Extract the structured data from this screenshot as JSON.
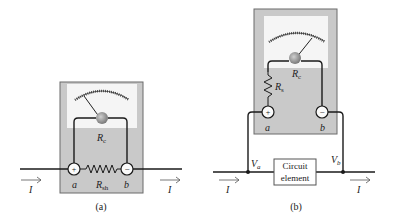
{
  "diagram_a": {
    "caption": "(a)",
    "meter_resistance": "R",
    "meter_resistance_sub": "c",
    "shunt_resistance": "R",
    "shunt_resistance_sub": "sh",
    "terminal_plus": "+",
    "terminal_minus": "−",
    "node_a": "a",
    "node_b": "b",
    "current_in": "I",
    "current_out": "I"
  },
  "diagram_b": {
    "caption": "(b)",
    "meter_resistance": "R",
    "meter_resistance_sub": "c",
    "series_resistance": "R",
    "series_resistance_sub": "s",
    "terminal_plus": "+",
    "terminal_minus": "−",
    "node_a": "a",
    "node_b": "b",
    "voltage_a": "V",
    "voltage_a_sub": "a",
    "voltage_b": "V",
    "voltage_b_sub": "b",
    "element_line1": "Circuit",
    "element_line2": "element",
    "current_in": "I",
    "current_out": "I"
  },
  "colors": {
    "meter_body": "#c8c8c8",
    "meter_border": "#6a6a6a",
    "dial_face": "#f4f4f4",
    "wire": "#1a1a1a",
    "pivot": "#8a8a8a"
  }
}
